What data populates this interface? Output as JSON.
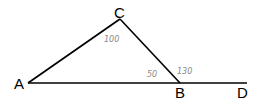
{
  "diagram": {
    "type": "triangle-with-exterior-angle",
    "points": {
      "A": {
        "label": "A",
        "x": 28,
        "y": 83
      },
      "B": {
        "label": "B",
        "x": 180,
        "y": 83
      },
      "C": {
        "label": "C",
        "x": 120,
        "y": 19
      },
      "D": {
        "label": "D",
        "x": 247,
        "y": 83
      }
    },
    "segments": [
      [
        "A",
        "C"
      ],
      [
        "C",
        "B"
      ],
      [
        "A",
        "D"
      ]
    ],
    "angle_annotations": {
      "angle_C": "100",
      "angle_ABC": "50",
      "angle_CBD": "130"
    },
    "colors": {
      "lines": "#000000",
      "annotations": "#888888"
    }
  }
}
